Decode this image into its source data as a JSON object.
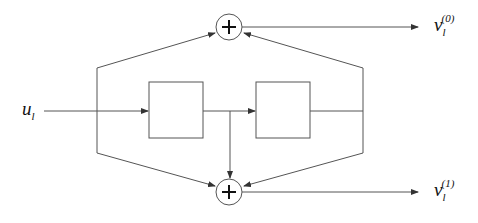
{
  "diagram": {
    "title": "",
    "type": "convolutional-encoder",
    "colors": {
      "line": "#555555",
      "text": "#111111",
      "background": "#ffffff"
    },
    "input": {
      "label": "u",
      "subscript": "l"
    },
    "outputs": [
      {
        "label": "v",
        "subscript": "l",
        "superscript": "(0)"
      },
      {
        "label": "v",
        "subscript": "l",
        "superscript": "(1)"
      }
    ],
    "nodes": [
      {
        "id": "adder-top",
        "kind": "adder",
        "symbol": "+"
      },
      {
        "id": "delay-1",
        "kind": "delay-box",
        "text": ""
      },
      {
        "id": "delay-2",
        "kind": "delay-box",
        "text": ""
      },
      {
        "id": "adder-bottom",
        "kind": "adder",
        "symbol": "+"
      }
    ],
    "edges": [
      {
        "from": "input",
        "to": "delay-1"
      },
      {
        "from": "delay-1",
        "to": "delay-2"
      },
      {
        "from": "input-tap",
        "to": "adder-top"
      },
      {
        "from": "input-tap",
        "to": "adder-bottom"
      },
      {
        "from": "delay-1-tap",
        "to": "adder-bottom"
      },
      {
        "from": "delay-2-tap",
        "to": "adder-top"
      },
      {
        "from": "delay-2-tap",
        "to": "adder-bottom"
      },
      {
        "from": "adder-top",
        "to": "output-0"
      },
      {
        "from": "adder-bottom",
        "to": "output-1"
      }
    ]
  }
}
